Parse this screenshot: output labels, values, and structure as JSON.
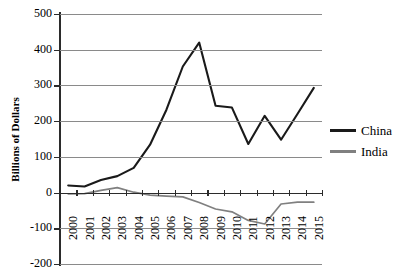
{
  "chart_data": {
    "type": "line",
    "title": "",
    "xlabel": "",
    "ylabel": "Billions of Dollars",
    "x": [
      2000,
      2001,
      2002,
      2003,
      2004,
      2005,
      2006,
      2007,
      2008,
      2009,
      2010,
      2011,
      2012,
      2013,
      2014,
      2015
    ],
    "categories": [
      "2000",
      "2001",
      "2002",
      "2003",
      "2004",
      "2005",
      "2006",
      "2007",
      "2008",
      "2009",
      "2010",
      "2011",
      "2012",
      "2013",
      "2014",
      "2015"
    ],
    "series": [
      {
        "name": "China",
        "color": "#1a1a1a",
        "values": [
          20,
          17,
          35,
          46,
          69,
          134,
          232,
          353,
          420,
          243,
          238,
          136,
          215,
          148,
          220,
          293
        ]
      },
      {
        "name": "India",
        "color": "#808080",
        "values": [
          -4,
          -3,
          6,
          14,
          1,
          -7,
          -10,
          -12,
          -28,
          -46,
          -54,
          -78,
          -88,
          -32,
          -27,
          -27
        ]
      }
    ],
    "ylim": [
      -200,
      500
    ],
    "ytick_labels": [
      "500",
      "400",
      "300",
      "200",
      "100",
      "0",
      "-100",
      "-200"
    ],
    "ytick_values": [
      500,
      400,
      300,
      200,
      100,
      0,
      -100,
      -200
    ],
    "grid": true,
    "legend_position": "right",
    "legend": [
      "China",
      "India"
    ]
  },
  "legend": {
    "items": [
      {
        "label": "China",
        "color": "#1a1a1a"
      },
      {
        "label": "India",
        "color": "#808080"
      }
    ]
  },
  "axes": {
    "y_title": "Billions of Dollars"
  }
}
